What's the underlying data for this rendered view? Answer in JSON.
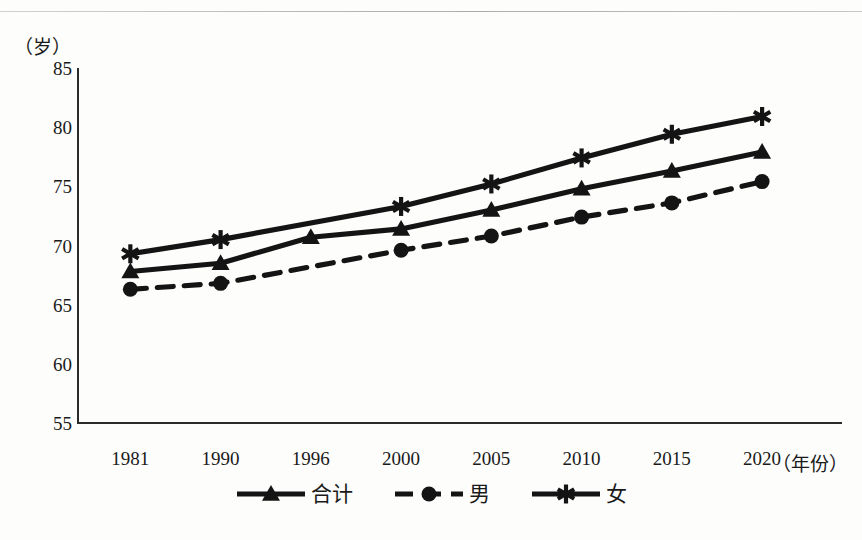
{
  "chart_data": {
    "type": "line",
    "title": "",
    "xlabel": "（年份）",
    "ylabel": "（岁）",
    "categories": [
      "1981",
      "1990",
      "1996",
      "2000",
      "2005",
      "2010",
      "2015",
      "2020"
    ],
    "ylim": [
      55,
      85
    ],
    "yticks": [
      "55",
      "60",
      "65",
      "70",
      "75",
      "80",
      "85"
    ],
    "grid": false,
    "legend_position": "bottom-center",
    "series": [
      {
        "name": "合计",
        "marker": "triangle",
        "line_style": "solid",
        "color": "#141414",
        "values": [
          67.8,
          68.5,
          70.7,
          71.4,
          73.0,
          74.8,
          76.3,
          77.9
        ]
      },
      {
        "name": "男",
        "marker": "circle",
        "line_style": "dashed",
        "color": "#141414",
        "values": [
          66.3,
          66.8,
          null,
          69.6,
          70.8,
          72.4,
          73.6,
          75.4
        ]
      },
      {
        "name": "女",
        "marker": "asterisk",
        "line_style": "solid",
        "color": "#141414",
        "values": [
          69.3,
          70.5,
          null,
          73.3,
          75.2,
          77.4,
          79.4,
          80.9
        ]
      }
    ]
  },
  "axes": {
    "y_unit_label": "（岁）",
    "x_unit_label": "（年份）"
  },
  "legend": {
    "items": [
      {
        "label": "合计",
        "marker": "triangle-marker",
        "dashed": false
      },
      {
        "label": "男",
        "marker": "circle-marker",
        "dashed": true
      },
      {
        "label": "女",
        "marker": "asterisk-marker",
        "dashed": false
      }
    ]
  },
  "page": {
    "footer_ghost_text": ""
  }
}
